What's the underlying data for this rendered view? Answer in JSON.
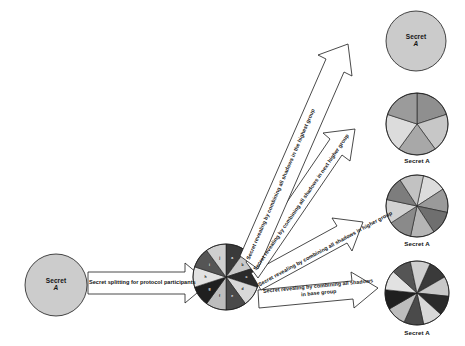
{
  "diagram": {
    "background": "#ffffff",
    "stroke": "#1a1a1a"
  },
  "source": {
    "node_name": "source-secret-circle",
    "label_line1": "Secret",
    "label_line2": "A",
    "fill": "#cccccc",
    "cx": 56,
    "cy": 285,
    "r": 31
  },
  "split_arrow": {
    "label": "Secret splitting for protocol participants",
    "fill": "#ffffff"
  },
  "base_pie": {
    "node_name": "base-group-pie",
    "cx": 226,
    "cy": 277,
    "r": 33,
    "segment_count": 10,
    "segment_labels": [
      "a",
      "b",
      "c",
      "d",
      "e",
      "f",
      "g",
      "h",
      "i",
      "j"
    ],
    "segment_fills": [
      "#3a3a3a",
      "#c9c9c9",
      "#2b2b2b",
      "#d8d8d8",
      "#4a4a4a",
      "#bdbdbd",
      "#1f1f1f",
      "#e2e2e2",
      "#555555",
      "#cfcfcf"
    ]
  },
  "targets": [
    {
      "node_name": "target-highest-group",
      "kind": "circle",
      "caption": "Secret",
      "caption_italic": "A",
      "caption_inside": true,
      "cx": 416,
      "cy": 41,
      "r": 30,
      "fill": "#cbcbcb",
      "arrow_label": "Secret revealing by combining all shadows in the highest group"
    },
    {
      "node_name": "target-next-higher-group",
      "kind": "pie",
      "caption": "Secret A",
      "caption_inside": false,
      "cx": 417,
      "cy": 124,
      "r": 31,
      "segment_count": 5,
      "segment_fills": [
        "#8f8f8f",
        "#c7c7c7",
        "#a8a8a8",
        "#dcdcdc",
        "#9b9b9b"
      ],
      "arrow_label": "Secret revealing by combining all shadows in next higher group"
    },
    {
      "node_name": "target-higher-group",
      "kind": "pie",
      "caption": "Secret A",
      "caption_inside": false,
      "cx": 417,
      "cy": 206,
      "r": 31,
      "segment_count": 8,
      "segment_fills": [
        "#dcdcdc",
        "#9a9a9a",
        "#6f6f6f",
        "#b5b5b5",
        "#8a8a8a",
        "#d2d2d2",
        "#7d7d7d",
        "#c2c2c2"
      ],
      "arrow_label": "Secret revealing by combining all shadows in higher group"
    },
    {
      "node_name": "target-base-group",
      "kind": "pie",
      "caption": "Secret A",
      "caption_inside": false,
      "cx": 417,
      "cy": 293,
      "r": 32,
      "segment_count": 10,
      "segment_fills": [
        "#3a3a3a",
        "#c9c9c9",
        "#2b2b2b",
        "#d8d8d8",
        "#4a4a4a",
        "#bdbdbd",
        "#1f1f1f",
        "#e2e2e2",
        "#555555",
        "#cfcfcf"
      ],
      "arrow_label_line1": "Secret revealing by combining all shadows",
      "arrow_label_line2": "in base group"
    }
  ]
}
